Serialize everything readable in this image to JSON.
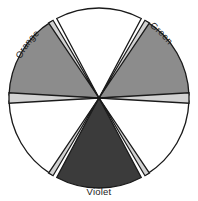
{
  "diagram": {
    "type": "color-wheel",
    "center": {
      "x": 99,
      "y": 98
    },
    "radius": 90,
    "colors": {
      "wedge_fill_medium": "#8c8c8c",
      "wedge_fill_dark": "#3b3b3b",
      "wedge_fill_light": "#ffffff",
      "spoke_fill": "#d2d2d2",
      "outline": "#1a1a1a",
      "background": "#ffffff",
      "text": "#1a1a1a"
    },
    "segments": [
      {
        "id": "segment-top",
        "label": "",
        "fill_key": "wedge_fill_light",
        "fill": "#ffffff",
        "center_angle_deg": -90
      },
      {
        "id": "segment-upper-right",
        "label": "Green",
        "fill_key": "wedge_fill_medium",
        "fill": "#8c8c8c",
        "center_angle_deg": -30
      },
      {
        "id": "segment-lower-right",
        "label": "",
        "fill_key": "wedge_fill_light",
        "fill": "#ffffff",
        "center_angle_deg": 30
      },
      {
        "id": "segment-bottom",
        "label": "Violet",
        "fill_key": "wedge_fill_dark",
        "fill": "#3b3b3b",
        "center_angle_deg": 90
      },
      {
        "id": "segment-lower-left",
        "label": "",
        "fill_key": "wedge_fill_light",
        "fill": "#ffffff",
        "center_angle_deg": 150
      },
      {
        "id": "segment-upper-left",
        "label": "Orange",
        "fill_key": "wedge_fill_medium",
        "fill": "#8c8c8c",
        "center_angle_deg": -150
      }
    ],
    "labels": {
      "orange": "Orange",
      "green": "Green",
      "violet": "Violet"
    }
  }
}
